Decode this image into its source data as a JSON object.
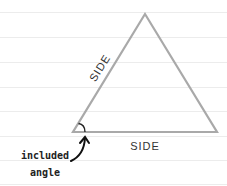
{
  "diagram": {
    "title": "",
    "colors": {
      "background": "#ffffff",
      "ruled_line": "#ececec",
      "triangle_stroke": "#a9a9a9",
      "text": "#222222"
    },
    "ruled_lines_y": [
      12,
      37,
      62,
      87,
      111,
      136,
      160,
      184
    ],
    "triangle": {
      "apex": [
        145,
        14
      ],
      "left": [
        73,
        132
      ],
      "right": [
        217,
        132
      ]
    },
    "labels": {
      "left_side": "SIDE",
      "bottom_side": "SIDE",
      "annotation_line1": "included",
      "annotation_line2": "angle"
    },
    "icons": {
      "angle_arc": "angle-arc-icon",
      "arrow": "curved-arrow-icon"
    }
  }
}
